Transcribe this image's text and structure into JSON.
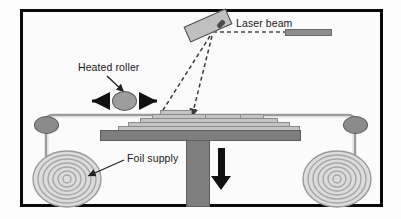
{
  "figure": {
    "type": "process-schematic",
    "background_color": "#fbfbfb",
    "border_color": "#0a0a0a"
  },
  "labels": {
    "laser_beam": "Laser beam",
    "heated_roller": "Heated roller",
    "foil_supply": "Foil supply"
  },
  "components": {
    "laser_head": "laser-head",
    "laser_source_bar": "laser-source-bar",
    "heated_roller": "heated-roller",
    "guide_roller_left": "guide-roller-left",
    "guide_roller_right": "guide-roller-right",
    "foil_spool_left": "foil-spool-left",
    "foil_spool_right": "foil-spool-right",
    "build_plate": "build-plate",
    "build_column": "build-column",
    "layer_stack": "stepped-layer-stack",
    "descent_arrow": "platform-descent-arrow",
    "roller_travel_arrow_left": "roller-travel-arrow-left",
    "roller_travel_arrow_right": "roller-travel-arrow-right",
    "beam_path_left": "laser-beam-path-left",
    "beam_path_right": "laser-beam-path-right",
    "foil_web": "foil-web-path"
  },
  "colors": {
    "metal_gray": "#8b8b8b",
    "layer_gray": "#c4c4c4",
    "plate_gray": "#7e7e7e",
    "laser_head_gray": "#c0c0c0",
    "arrow_black": "#111111",
    "spiral_gray": "#a6a6a6",
    "outline_gray": "#5c5c5c"
  },
  "layers": {
    "left_steps": [
      {
        "x": 118,
        "y": 127,
        "w": 182,
        "h": 4
      },
      {
        "x": 128,
        "y": 123,
        "w": 162,
        "h": 4
      },
      {
        "x": 140,
        "y": 119,
        "w": 138,
        "h": 4
      },
      {
        "x": 152,
        "y": 115,
        "w": 112,
        "h": 4
      }
    ],
    "top_left_block": {
      "x": 160,
      "y": 111,
      "w": 32,
      "h": 5
    },
    "top_right_block": {
      "x": 205,
      "y": 115,
      "w": 36,
      "h": 4
    },
    "gap_note": "white slot between the two top blocks under the vertical beam"
  },
  "spirals": {
    "ring_count": 7,
    "left_center": {
      "x": 67,
      "y": 179
    },
    "right_center": {
      "x": 337,
      "y": 179
    }
  },
  "annotations": {
    "heated_roller_leader": "arrow from label down-right to roller",
    "foil_supply_leader": "arrow from label down-left to left spool",
    "laser_beam_leader": "dashed line from label right to laser source bar",
    "beam_arrowhead": "small arrowhead at bottom of vertical beam on the work surface"
  }
}
